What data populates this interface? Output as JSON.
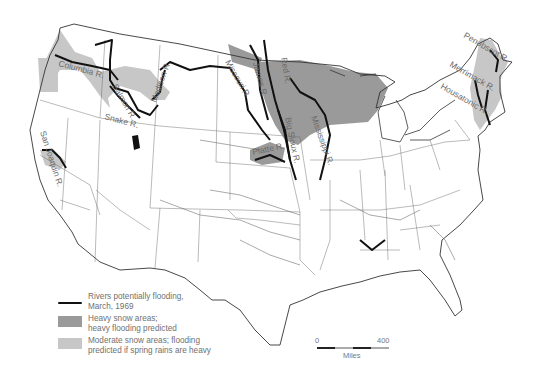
{
  "map": {
    "title": "Rivers potentially flooding, March, 1969",
    "rivers": [
      {
        "label": "Columbia R.",
        "x": 58,
        "y": 66,
        "rotate": 15
      },
      {
        "label": "Salmon R.",
        "x": 112,
        "y": 86,
        "rotate": 60
      },
      {
        "label": "Snake R.",
        "x": 104,
        "y": 119,
        "rotate": 15
      },
      {
        "label": "Madison R.",
        "x": 156,
        "y": 103,
        "rotate": -70
      },
      {
        "label": "Missouri R.",
        "x": 225,
        "y": 62,
        "rotate": 60
      },
      {
        "label": "James R.",
        "x": 253,
        "y": 63,
        "rotate": 75
      },
      {
        "label": "Red R.",
        "x": 281,
        "y": 58,
        "rotate": 80
      },
      {
        "label": "Big Sioux R.",
        "x": 285,
        "y": 118,
        "rotate": 78
      },
      {
        "label": "Mississippi R.",
        "x": 311,
        "y": 117,
        "rotate": 70
      },
      {
        "label": "Platte R.",
        "x": 253,
        "y": 155,
        "rotate": -12
      },
      {
        "label": "San Joaquin R.",
        "x": 40,
        "y": 132,
        "rotate": 72
      },
      {
        "label": "Penobscot R.",
        "x": 463,
        "y": 37,
        "rotate": 30
      },
      {
        "label": "Merrimack R.",
        "x": 449,
        "y": 66,
        "rotate": 30
      },
      {
        "label": "Housatonic R.",
        "x": 440,
        "y": 88,
        "rotate": 30
      }
    ]
  },
  "legend": {
    "items": [
      {
        "key": "river",
        "text_line1": "Rivers potentially flooding,",
        "text_line2": "March, 1969"
      },
      {
        "key": "heavy",
        "text_line1": "Heavy snow areas;",
        "text_line2": "heavy flooding predicted"
      },
      {
        "key": "moderate",
        "text_line1": "Moderate snow areas; flooding",
        "text_line2": "predicted if spring rains are heavy"
      }
    ]
  },
  "scale": {
    "start": "0",
    "end": "400",
    "unit": "Miles"
  },
  "colors": {
    "heavy": "#9a9a9a",
    "moderate": "#c7c7c7",
    "river": "#111111",
    "border": "#333333"
  }
}
